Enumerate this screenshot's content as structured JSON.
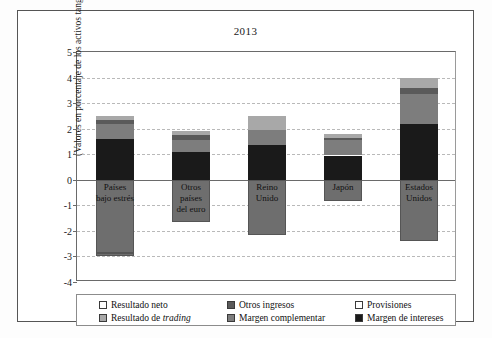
{
  "chart_data": {
    "type": "bar",
    "subtype": "stacked-bar-with-negatives",
    "title": "2013",
    "xlabel": "",
    "ylabel": "(Valores en porcentaje de los activos tangibles)",
    "ylim": [
      -4,
      5
    ],
    "yticks": [
      5,
      4,
      3,
      2,
      1,
      0,
      -1,
      -2,
      -3,
      -4
    ],
    "ytick_labels": [
      "5",
      "4",
      "3",
      "2",
      "1",
      "0",
      "-1",
      "-2",
      "-3",
      "-4"
    ],
    "grid": true,
    "grid_style": "dashed-horizontal",
    "legend_position": "bottom",
    "categories": [
      "Países bajo estrés",
      "Otros países del euro",
      "Reino Unido",
      "Japón",
      "Estados Unidos"
    ],
    "category_labels_wrapped": [
      [
        "Países",
        "bajo estrés"
      ],
      [
        "Otros",
        "países",
        "del euro"
      ],
      [
        "Reino",
        "Unido"
      ],
      [
        "Japón"
      ],
      [
        "Estados",
        "Unidos"
      ]
    ],
    "series": [
      {
        "name": "Margen de intereses",
        "color": "#1a1a1a",
        "values": [
          1.6,
          1.1,
          1.35,
          0.95,
          2.2
        ]
      },
      {
        "name": "Margen complementar",
        "color": "#7d7d7d",
        "values": [
          0.6,
          0.45,
          0.6,
          0.6,
          1.15
        ]
      },
      {
        "name": "Otros ingresos",
        "color": "#5a5a5a",
        "values": [
          0.15,
          0.2,
          0.0,
          0.1,
          0.25
        ]
      },
      {
        "name": "Resultado de trading",
        "color": "#a8a8a8",
        "values": [
          0.15,
          0.15,
          0.55,
          0.15,
          0.4
        ]
      },
      {
        "name": "Provisiones",
        "color": "#ffffff",
        "values": [
          -2.85,
          -1.65,
          -2.15,
          -0.85,
          -2.4
        ]
      },
      {
        "name": "Resultado neto",
        "color": "#ffffff",
        "values": [
          -0.15,
          0.0,
          0.0,
          0.0,
          0.0
        ]
      }
    ],
    "totals_positive": [
      2.5,
      1.9,
      2.5,
      1.8,
      4.0
    ],
    "totals_negative": [
      -2.95,
      -1.65,
      -2.15,
      -0.85,
      -2.4
    ],
    "annotations": []
  },
  "legend": {
    "items": [
      {
        "label": "Resultado neto",
        "swatch": "#ffffff",
        "italic_word": ""
      },
      {
        "label": "Otros ingresos",
        "swatch": "#5a5a5a",
        "italic_word": ""
      },
      {
        "label": "Provisiones",
        "swatch": "#ffffff",
        "italic_word": ""
      },
      {
        "label": "Resultado de ",
        "swatch": "#a8a8a8",
        "italic_word": "trading"
      },
      {
        "label": "Margen complementar",
        "swatch": "#7d7d7d",
        "italic_word": ""
      },
      {
        "label": "Margen de intereses",
        "swatch": "#1a1a1a",
        "italic_word": ""
      }
    ]
  },
  "colors": {
    "margen_intereses": "#1a1a1a",
    "margen_complementar": "#7d7d7d",
    "otros_ingresos": "#5a5a5a",
    "resultado_trading": "#a8a8a8",
    "provisiones": "#ffffff",
    "resultado_neto": "#ffffff",
    "negative_fill": "#6e6e6e",
    "axis": "#6a6a6a",
    "grid": "#b9b9b9",
    "frame": "#555555",
    "text": "#1a1a1a"
  }
}
